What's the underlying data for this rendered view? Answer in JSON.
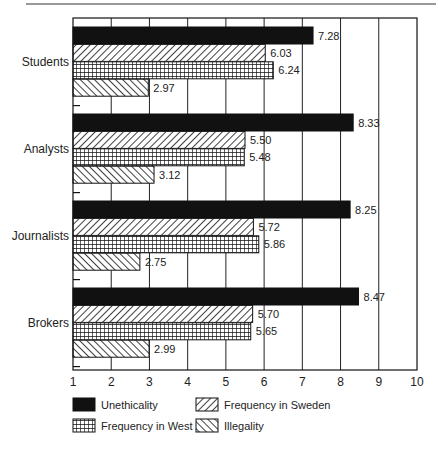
{
  "chart_data": {
    "type": "bar",
    "orientation": "horizontal",
    "title": "",
    "xlabel": "",
    "ylabel": "",
    "xlim": [
      1,
      10
    ],
    "x_ticks": [
      "1",
      "2",
      "3",
      "4",
      "5",
      "6",
      "7",
      "8",
      "9",
      "10"
    ],
    "grid": "vertical",
    "legend_position": "bottom",
    "categories": [
      "Students",
      "Analysts",
      "Journalists",
      "Brokers"
    ],
    "series": [
      {
        "name": "Unethicality",
        "pattern": "solid-black",
        "values": [
          7.28,
          8.33,
          8.25,
          8.47
        ],
        "labels": [
          "7.28",
          "8.33",
          "8.25",
          "8.47"
        ]
      },
      {
        "name": "Frequency in Sweden",
        "pattern": "forward-diagonal-hatch",
        "values": [
          6.03,
          5.5,
          5.72,
          5.7
        ],
        "labels": [
          "6.03",
          "5.50",
          "5.72",
          "5.70"
        ]
      },
      {
        "name": "Frequency in West",
        "pattern": "crosshatch-grid",
        "values": [
          6.24,
          5.48,
          5.86,
          5.65
        ],
        "labels": [
          "6.24",
          "5.48",
          "5.86",
          "5.65"
        ]
      },
      {
        "name": "Illegality",
        "pattern": "backward-diagonal-hatch",
        "values": [
          2.97,
          3.12,
          2.75,
          2.99
        ],
        "labels": [
          "2.97",
          "3.12",
          "2.75",
          "2.99"
        ]
      }
    ],
    "legend": [
      {
        "name": "Unethicality",
        "pattern": "solid-black"
      },
      {
        "name": "Frequency in Sweden",
        "pattern": "forward-diagonal-hatch"
      },
      {
        "name": "Frequency in West",
        "pattern": "crosshatch-grid"
      },
      {
        "name": "Illegality",
        "pattern": "backward-diagonal-hatch"
      }
    ]
  },
  "colors": {
    "bar_fill": "#111111",
    "grid": "#222222",
    "background": "#ffffff"
  }
}
